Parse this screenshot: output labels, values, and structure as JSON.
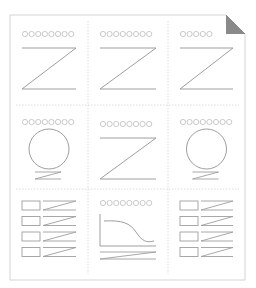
{
  "illustration": {
    "name": "document-layout-wireframe",
    "colors": {
      "page_border": "#d4d4d4",
      "divider": "#dcdcdc",
      "stroke": "#9e9e9e",
      "dot": "#bdbdbd",
      "dog_ear": "#8a8a8a",
      "background": "#ffffff"
    },
    "page": {
      "x": 10,
      "y": 15,
      "width": 235,
      "height": 265,
      "dog_ear_size": 19
    },
    "grid": {
      "columns": [
        10,
        88,
        168,
        245
      ],
      "rows": [
        15,
        105,
        189,
        280
      ]
    },
    "cells": [
      {
        "row": 0,
        "col": 0,
        "type": "heading-z",
        "dots": 8
      },
      {
        "row": 0,
        "col": 1,
        "type": "heading-z",
        "dots": 8
      },
      {
        "row": 0,
        "col": 2,
        "type": "heading-z",
        "dots": 5
      },
      {
        "row": 1,
        "col": 0,
        "type": "heading-circle",
        "dots": 8
      },
      {
        "row": 1,
        "col": 1,
        "type": "heading-z",
        "dots": 8
      },
      {
        "row": 1,
        "col": 2,
        "type": "heading-circle",
        "dots": 8
      },
      {
        "row": 2,
        "col": 0,
        "type": "list",
        "items": 4
      },
      {
        "row": 2,
        "col": 1,
        "type": "heading-curve",
        "dots": 8
      },
      {
        "row": 2,
        "col": 2,
        "type": "list",
        "items": 4
      }
    ]
  }
}
